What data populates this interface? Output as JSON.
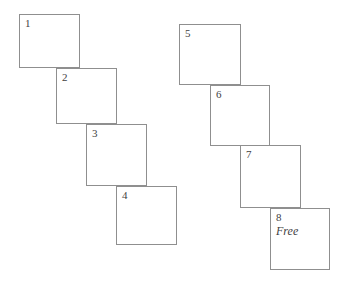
{
  "figure": {
    "background_color": "#ffffff",
    "border_color": "#8f8f8f",
    "text_color": "#3f3f3f",
    "free_label": "Free",
    "squares": [
      {
        "label": "1",
        "sublabel": "",
        "x": 19,
        "y": 14,
        "w": 61,
        "h": 54
      },
      {
        "label": "2",
        "sublabel": "",
        "x": 56,
        "y": 68,
        "w": 61,
        "h": 56
      },
      {
        "label": "3",
        "sublabel": "",
        "x": 86,
        "y": 124,
        "w": 61,
        "h": 62
      },
      {
        "label": "4",
        "sublabel": "",
        "x": 116,
        "y": 186,
        "w": 61,
        "h": 59
      },
      {
        "label": "5",
        "sublabel": "",
        "x": 179,
        "y": 24,
        "w": 62,
        "h": 61
      },
      {
        "label": "6",
        "sublabel": "",
        "x": 210,
        "y": 85,
        "w": 60,
        "h": 61
      },
      {
        "label": "7",
        "sublabel": "",
        "x": 240,
        "y": 145,
        "w": 61,
        "h": 63
      },
      {
        "label": "8",
        "sublabel": "Free",
        "x": 270,
        "y": 208,
        "w": 60,
        "h": 62
      }
    ]
  }
}
